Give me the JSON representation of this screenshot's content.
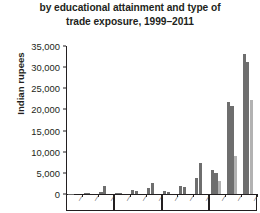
{
  "chart_data": {
    "type": "bar",
    "title": "by educational attainment and type of trade exposure, 1999–2011",
    "title_line1": "by educational attainment and type of",
    "title_line2": "trade exposure, 1999–2011",
    "xlabel": "",
    "ylabel": "Indian rupees",
    "ylim": [
      0,
      35000
    ],
    "ytick_values": [
      0,
      5000,
      10000,
      15000,
      20000,
      25000,
      30000,
      35000
    ],
    "ytick_labels": [
      "0",
      "5,000",
      "10,000",
      "15,000",
      "20,000",
      "25,000",
      "30,000",
      "35,000"
    ],
    "grid": false,
    "legend": "none",
    "panel_count": 4,
    "categories_per_panel": 3,
    "categories": [
      "a",
      "b",
      "c",
      "a",
      "b",
      "c",
      "a",
      "b",
      "c",
      "a",
      "b",
      "c"
    ],
    "xtick_labels": [
      "",
      "",
      "",
      "",
      "",
      "",
      "",
      "",
      "",
      "",
      "",
      ""
    ],
    "colors": {
      "dark": "#6e6e6e",
      "light": "#b2b2b2",
      "axis": "#231f20"
    },
    "series": [
      {
        "name": "dark",
        "values": [
          120,
          300,
          480,
          260,
          900,
          1400,
          700,
          2000,
          3900,
          5600,
          21800,
          33000
        ]
      },
      {
        "name": "light",
        "values": [
          90,
          250,
          1800,
          200,
          750,
          2600,
          500,
          1700,
          7400,
          4900,
          20800,
          31300
        ]
      }
    ],
    "extra_light": {
      "values": [
        0,
        0,
        0,
        0,
        0,
        0,
        0,
        0,
        0,
        3100,
        9100,
        22200
      ]
    }
  }
}
